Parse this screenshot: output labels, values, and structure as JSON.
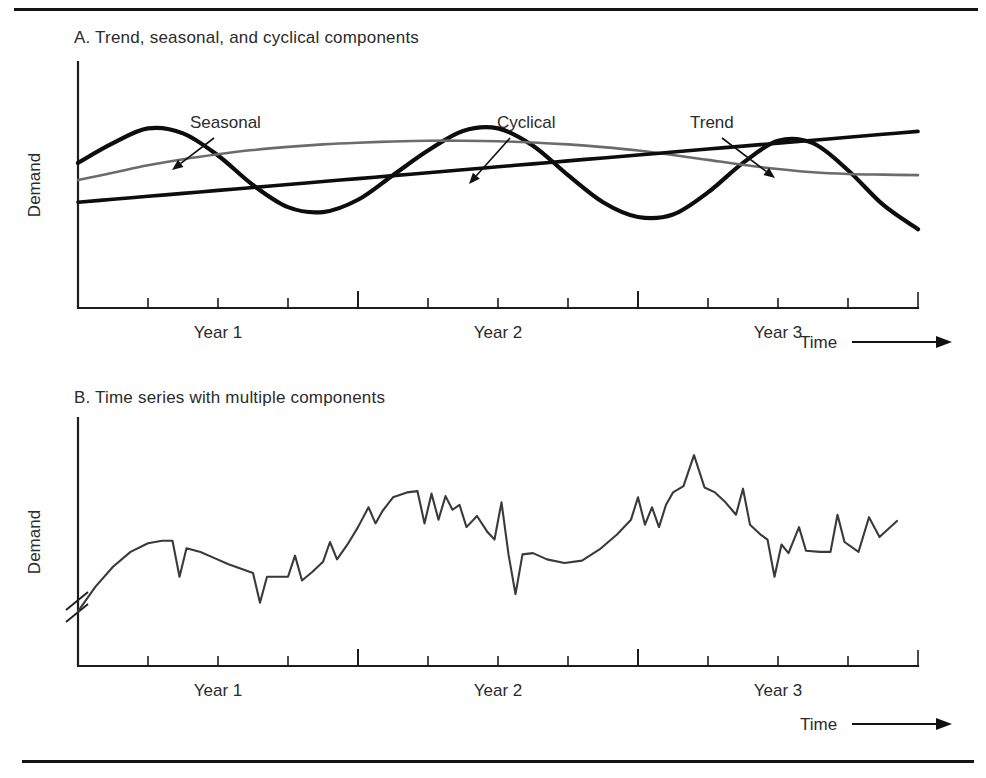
{
  "figure": {
    "background_color": "#ffffff",
    "ink_color": "#1a1a1a",
    "accent_gray": "#6b6b6b",
    "top_rule": true,
    "bottom_rule": true
  },
  "panel_a": {
    "title": "A. Trend, seasonal, and cyclical components",
    "y_axis_label": "Demand",
    "x_axis_label": "Time",
    "x_tick_labels": [
      "Year 1",
      "Year 2",
      "Year 3"
    ],
    "annotations": [
      {
        "label": "Seasonal",
        "target": "seasonal-curve"
      },
      {
        "label": "Cyclical",
        "target": "cyclical-curve"
      },
      {
        "label": "Trend",
        "target": "trend-line"
      }
    ]
  },
  "panel_b": {
    "title": "B. Time series with multiple components",
    "y_axis_label": "Demand",
    "x_axis_label": "Time",
    "x_tick_labels": [
      "Year 1",
      "Year 2",
      "Year 3"
    ],
    "axis_break": true
  },
  "chart_data": [
    {
      "id": "panel-a",
      "type": "line",
      "title": "A. Trend, seasonal, and cyclical components",
      "xlabel": "Time",
      "ylabel": "Demand",
      "xlim": [
        0,
        12
      ],
      "ylim": [
        0,
        10
      ],
      "grid": false,
      "legend": "annotated-arrows",
      "x_tick_labels": [
        "Year 1",
        "Year 2",
        "Year 3"
      ],
      "x_tick_positions": [
        2,
        6,
        10
      ],
      "minor_tick_positions": [
        1,
        2,
        3,
        4,
        5,
        6,
        7,
        8,
        9,
        10,
        11
      ],
      "major_tick_positions": [
        4,
        8
      ],
      "x": [
        0,
        0.5,
        1,
        1.5,
        2,
        2.5,
        3,
        3.5,
        4,
        4.5,
        5,
        5.5,
        6,
        6.5,
        7,
        7.5,
        8,
        8.5,
        9,
        9.5,
        10,
        10.5,
        11,
        11.5,
        12
      ],
      "series": [
        {
          "name": "Seasonal",
          "color": "#0d0d0d",
          "width": 4.2,
          "values": [
            5.9,
            6.7,
            7.3,
            7.1,
            6.2,
            5.0,
            4.1,
            3.9,
            4.4,
            5.4,
            6.4,
            7.2,
            7.3,
            6.6,
            5.4,
            4.3,
            3.7,
            3.8,
            4.7,
            5.9,
            6.8,
            6.7,
            5.6,
            4.2,
            3.2
          ]
        },
        {
          "name": "Cyclical",
          "color": "#6b6b6b",
          "width": 2.6,
          "values": [
            5.2,
            5.5,
            5.8,
            6.05,
            6.25,
            6.42,
            6.55,
            6.65,
            6.72,
            6.77,
            6.8,
            6.8,
            6.78,
            6.73,
            6.65,
            6.54,
            6.4,
            6.22,
            6.02,
            5.82,
            5.65,
            5.52,
            5.45,
            5.42,
            5.4
          ]
        },
        {
          "name": "Trend",
          "color": "#0d0d0d",
          "width": 3.6,
          "values": [
            4.3,
            4.42,
            4.54,
            4.66,
            4.78,
            4.9,
            5.02,
            5.14,
            5.26,
            5.38,
            5.5,
            5.62,
            5.74,
            5.86,
            5.98,
            6.1,
            6.22,
            6.34,
            6.46,
            6.58,
            6.7,
            6.82,
            6.94,
            7.06,
            7.18
          ]
        }
      ],
      "annotations": [
        {
          "text": "Seasonal",
          "points_to": "Seasonal"
        },
        {
          "text": "Cyclical",
          "points_to": "Cyclical"
        },
        {
          "text": "Trend",
          "points_to": "Trend"
        }
      ]
    },
    {
      "id": "panel-b",
      "type": "line",
      "title": "B. Time series with multiple components",
      "xlabel": "Time",
      "ylabel": "Demand",
      "xlim": [
        0,
        12
      ],
      "ylim": [
        0,
        10
      ],
      "grid": false,
      "y_axis_break": true,
      "x_tick_labels": [
        "Year 1",
        "Year 2",
        "Year 3"
      ],
      "x_tick_positions": [
        2,
        6,
        10
      ],
      "series": [
        {
          "name": "Observed demand",
          "color": "#3a3a3a",
          "width": 2.1,
          "points": [
            [
              0.0,
              2.2
            ],
            [
              0.25,
              3.2
            ],
            [
              0.5,
              4.0
            ],
            [
              0.75,
              4.6
            ],
            [
              1.0,
              4.95
            ],
            [
              1.2,
              5.05
            ],
            [
              1.35,
              5.05
            ],
            [
              1.45,
              3.6
            ],
            [
              1.55,
              4.75
            ],
            [
              1.75,
              4.6
            ],
            [
              1.95,
              4.35
            ],
            [
              2.15,
              4.1
            ],
            [
              2.35,
              3.9
            ],
            [
              2.5,
              3.75
            ],
            [
              2.6,
              2.55
            ],
            [
              2.7,
              3.6
            ],
            [
              2.85,
              3.6
            ],
            [
              3.0,
              3.6
            ],
            [
              3.1,
              4.45
            ],
            [
              3.2,
              3.45
            ],
            [
              3.35,
              3.8
            ],
            [
              3.5,
              4.2
            ],
            [
              3.6,
              5.0
            ],
            [
              3.7,
              4.3
            ],
            [
              3.85,
              4.9
            ],
            [
              4.0,
              5.6
            ],
            [
              4.15,
              6.4
            ],
            [
              4.25,
              5.75
            ],
            [
              4.35,
              6.25
            ],
            [
              4.5,
              6.8
            ],
            [
              4.7,
              7.0
            ],
            [
              4.85,
              7.05
            ],
            [
              4.95,
              5.75
            ],
            [
              5.05,
              6.95
            ],
            [
              5.15,
              5.9
            ],
            [
              5.25,
              6.85
            ],
            [
              5.35,
              6.3
            ],
            [
              5.45,
              6.5
            ],
            [
              5.55,
              5.6
            ],
            [
              5.7,
              6.05
            ],
            [
              5.85,
              5.4
            ],
            [
              5.95,
              5.1
            ],
            [
              6.05,
              6.6
            ],
            [
              6.15,
              4.5
            ],
            [
              6.25,
              2.9
            ],
            [
              6.35,
              4.5
            ],
            [
              6.5,
              4.55
            ],
            [
              6.7,
              4.3
            ],
            [
              6.95,
              4.15
            ],
            [
              7.2,
              4.25
            ],
            [
              7.45,
              4.7
            ],
            [
              7.7,
              5.3
            ],
            [
              7.9,
              5.9
            ],
            [
              8.0,
              6.8
            ],
            [
              8.1,
              5.7
            ],
            [
              8.2,
              6.4
            ],
            [
              8.3,
              5.6
            ],
            [
              8.4,
              6.5
            ],
            [
              8.5,
              7.0
            ],
            [
              8.65,
              7.25
            ],
            [
              8.8,
              8.5
            ],
            [
              8.95,
              7.2
            ],
            [
              9.1,
              7.0
            ],
            [
              9.25,
              6.6
            ],
            [
              9.4,
              6.1
            ],
            [
              9.5,
              7.15
            ],
            [
              9.6,
              5.7
            ],
            [
              9.75,
              5.3
            ],
            [
              9.85,
              5.1
            ],
            [
              9.95,
              3.6
            ],
            [
              10.05,
              4.9
            ],
            [
              10.15,
              4.55
            ],
            [
              10.3,
              5.6
            ],
            [
              10.4,
              4.65
            ],
            [
              10.6,
              4.6
            ],
            [
              10.75,
              4.6
            ],
            [
              10.85,
              6.1
            ],
            [
              10.95,
              5.0
            ],
            [
              11.15,
              4.6
            ],
            [
              11.3,
              6.0
            ],
            [
              11.45,
              5.2
            ],
            [
              11.7,
              5.85
            ]
          ]
        }
      ]
    }
  ]
}
